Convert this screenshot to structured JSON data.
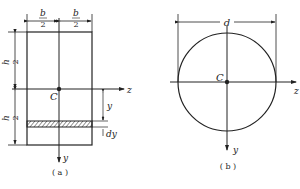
{
  "figure_a": {
    "caption": "( a )",
    "width_half_num": "b",
    "width_half_den": "2",
    "height_half_num": "h",
    "height_half_den": "2",
    "centroid": "C",
    "axis_z": "z",
    "axis_y": "y",
    "strip_distance": "y",
    "strip_thickness": "dy"
  },
  "figure_b": {
    "caption": "( b )",
    "diameter": "d",
    "centroid": "C",
    "axis_z": "z",
    "axis_y": "y"
  },
  "colors": {
    "line": "#222222",
    "background": "#ffffff"
  }
}
